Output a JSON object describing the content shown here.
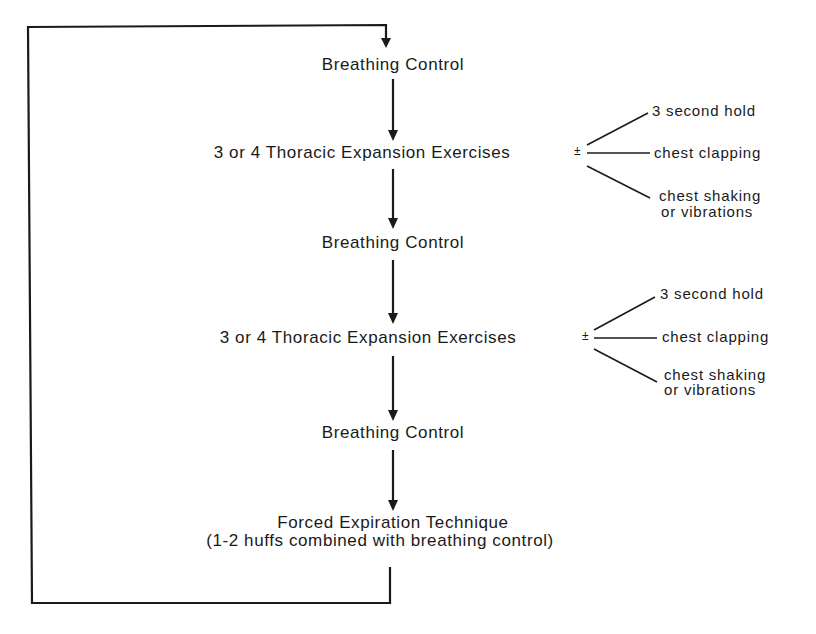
{
  "diagram": {
    "type": "flowchart-loop",
    "steps": [
      {
        "id": "step1",
        "label": "Breathing Control"
      },
      {
        "id": "step2",
        "label": "3 or 4 Thoracic Expansion Exercises",
        "modifier": "±",
        "options": [
          "3 second hold",
          "chest clapping",
          "chest shaking",
          "or vibrations"
        ]
      },
      {
        "id": "step3",
        "label": "Breathing Control"
      },
      {
        "id": "step4",
        "label": "3 or 4 Thoracic Expansion Exercises",
        "modifier": "±",
        "options": [
          "3 second hold",
          "chest clapping",
          "chest shaking",
          "or vibrations"
        ]
      },
      {
        "id": "step5",
        "label": "Breathing Control"
      },
      {
        "id": "step6",
        "label": "Forced Expiration Technique",
        "sublabel": "(1-2 huffs combined with breathing control)"
      }
    ],
    "loop": "returns from last step to first step",
    "colors": {
      "line": "#1a1a1a",
      "background": "#ffffff"
    }
  }
}
